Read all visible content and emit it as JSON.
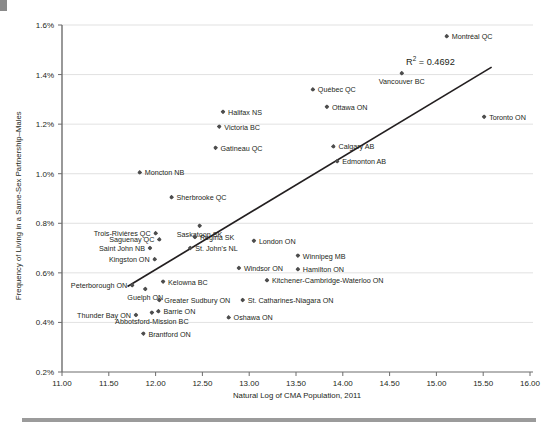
{
  "chart_data": {
    "type": "scatter",
    "title": "",
    "xlabel": "Natural Log of CMA Population, 2011",
    "ylabel": "Frequency of Living in a Same-Sex Partnership–Males",
    "xlim": [
      11.0,
      16.0
    ],
    "ylim": [
      0.2,
      1.6
    ],
    "xticks": [
      "11.00",
      "11.50",
      "12.00",
      "12.50",
      "13.00",
      "13.50",
      "14.00",
      "14.50",
      "15.00",
      "15.50",
      "16.00"
    ],
    "xtick_values": [
      11.0,
      11.5,
      12.0,
      12.5,
      13.0,
      13.5,
      14.0,
      14.5,
      15.0,
      15.5,
      16.0
    ],
    "yticks": [
      "0.2%",
      "0.4%",
      "0.6%",
      "0.8%",
      "1.0%",
      "1.2%",
      "1.4%",
      "1.6%"
    ],
    "ytick_values": [
      0.2,
      0.4,
      0.6,
      0.8,
      1.0,
      1.2,
      1.4,
      1.6
    ],
    "grid": true,
    "grid_axis": "y",
    "legend": "none",
    "annotations": [
      {
        "text": "R² = 0.4692",
        "x": 14.68,
        "y": 1.455
      }
    ],
    "trendline": {
      "label": "linear-fit",
      "x_start": 11.7,
      "y_start": 0.545,
      "x_end": 15.59,
      "y_end": 1.43,
      "r_squared": 0.4692
    },
    "points": [
      {
        "label": "Montréal QC",
        "x": 15.11,
        "y": 1.555,
        "label_pos": "right"
      },
      {
        "label": "Vancouver BC",
        "x": 14.63,
        "y": 1.405,
        "label_pos": "below"
      },
      {
        "label": "Québec QC",
        "x": 13.68,
        "y": 1.34,
        "label_pos": "right"
      },
      {
        "label": "Ottawa ON",
        "x": 13.83,
        "y": 1.27,
        "label_pos": "right"
      },
      {
        "label": "Halifax NS",
        "x": 12.72,
        "y": 1.25,
        "label_pos": "right"
      },
      {
        "label": "Toronto ON",
        "x": 15.51,
        "y": 1.23,
        "label_pos": "right"
      },
      {
        "label": "Victoria BC",
        "x": 12.68,
        "y": 1.19,
        "label_pos": "right"
      },
      {
        "label": "Calgary AB",
        "x": 13.9,
        "y": 1.11,
        "label_pos": "right"
      },
      {
        "label": "Gatineau QC",
        "x": 12.64,
        "y": 1.105,
        "label_pos": "right"
      },
      {
        "label": "Edmonton AB",
        "x": 13.94,
        "y": 1.05,
        "label_pos": "right"
      },
      {
        "label": "Moncton NB",
        "x": 11.83,
        "y": 1.005,
        "label_pos": "right"
      },
      {
        "label": "Sherbrooke QC",
        "x": 12.17,
        "y": 0.905,
        "label_pos": "right"
      },
      {
        "label": "Saskatoon SK",
        "x": 12.47,
        "y": 0.79,
        "label_pos": "below"
      },
      {
        "label": "Trois-Rivières QC",
        "x": 12.0,
        "y": 0.76,
        "label_pos": "left"
      },
      {
        "label": "Regina SK",
        "x": 12.42,
        "y": 0.745,
        "label_pos": "right"
      },
      {
        "label": "Saguenay QC",
        "x": 12.04,
        "y": 0.735,
        "label_pos": "left"
      },
      {
        "label": "London ON",
        "x": 13.05,
        "y": 0.73,
        "label_pos": "right"
      },
      {
        "label": "St. John's NL",
        "x": 12.37,
        "y": 0.7,
        "label_pos": "right"
      },
      {
        "label": "Saint John NB",
        "x": 11.94,
        "y": 0.7,
        "label_pos": "left"
      },
      {
        "label": "Winnipeg MB",
        "x": 13.52,
        "y": 0.67,
        "label_pos": "right"
      },
      {
        "label": "Kingston ON",
        "x": 11.99,
        "y": 0.655,
        "label_pos": "left"
      },
      {
        "label": "Windsor ON",
        "x": 12.89,
        "y": 0.62,
        "label_pos": "right"
      },
      {
        "label": "Hamilton ON",
        "x": 13.52,
        "y": 0.615,
        "label_pos": "right"
      },
      {
        "label": "Kelowna BC",
        "x": 12.08,
        "y": 0.565,
        "label_pos": "right"
      },
      {
        "label": "Kitchener-Cambridge-Waterloo ON",
        "x": 13.19,
        "y": 0.57,
        "label_pos": "right"
      },
      {
        "label": "Peterborough ON",
        "x": 11.75,
        "y": 0.55,
        "label_pos": "left"
      },
      {
        "label": "Guelph ON",
        "x": 11.89,
        "y": 0.535,
        "label_pos": "below"
      },
      {
        "label": "Greater Sudbury ON",
        "x": 12.04,
        "y": 0.49,
        "label_pos": "right"
      },
      {
        "label": "St. Catharines-Niagara ON",
        "x": 12.93,
        "y": 0.49,
        "label_pos": "right"
      },
      {
        "label": "Barrie ON",
        "x": 12.03,
        "y": 0.445,
        "label_pos": "right"
      },
      {
        "label": "Abbotsford-Mission BC",
        "x": 11.96,
        "y": 0.44,
        "label_pos": "below"
      },
      {
        "label": "Thunder Bay ON",
        "x": 11.79,
        "y": 0.43,
        "label_pos": "left"
      },
      {
        "label": "Oshawa ON",
        "x": 12.78,
        "y": 0.42,
        "label_pos": "right"
      },
      {
        "label": "Brantford ON",
        "x": 11.87,
        "y": 0.355,
        "label_pos": "right"
      }
    ]
  },
  "axis": {
    "r2_text": "R",
    "r2_sup": "2",
    "r2_value": " = 0.4692"
  }
}
